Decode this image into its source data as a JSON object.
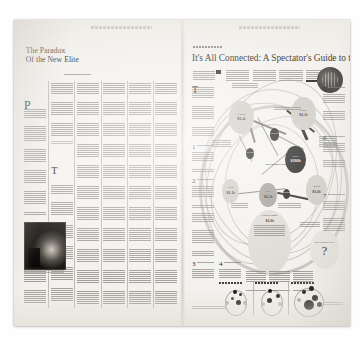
{
  "image": {
    "kind": "photograph-of-newspaper-spread",
    "publication": "The New York Times",
    "background_color": "#ffffff",
    "paper_color": "#f3f1ed",
    "ink_color": "#100f0a"
  },
  "left_page": {
    "folio_text": "THE NEW YORK TIMES, SUNDAY, ...",
    "headline_line1": "The Paradox",
    "headline_line2": "Of the New Elite",
    "dropcaps": [
      "P",
      "T"
    ],
    "subhead": "Reframing the American myth is what is really rewarding the elite.",
    "photo_caption": "photo"
  },
  "right_page": {
    "folio_text": "THE NEW YORK TIMES, SUNDAY, ...",
    "kicker": "SUNDAY BUSINESS",
    "headline": "It's All Connected: A Spectator's Guide to the Euro Crisis",
    "deck": "Charting the web of debt exposure among rippling economies",
    "legend_label": "Exposure",
    "sections": [
      {
        "number": "1",
        "title_line1": "Where Debt",
        "title_line2": "Has Gone"
      },
      {
        "number": "2",
        "title_line1": "And Then Bad",
        "title_line2": "Got Worse"
      },
      {
        "number": "3",
        "title_line1": "Threatening",
        "title_line2": "Contagion"
      },
      {
        "number": "4",
        "title_line1": "The Credit",
        "title_line2": "Crunch Spreads"
      },
      {
        "number": "5",
        "title_line1": "And Maybe",
        "title_line2": "Another Recession"
      },
      {
        "number": "6",
        "title_line1": "A Very Delicate",
        "title_line2": "Sort Of Surgery"
      },
      {
        "number": "7",
        "title_line1": "Any Way Out?",
        "title_line2": ""
      }
    ],
    "center_label": "The Market Now",
    "nodes": [
      {
        "id": "germany",
        "label": "Germany",
        "value": "$1.2t",
        "tone": "light"
      },
      {
        "id": "france",
        "label": "France",
        "value": "$1.1t",
        "tone": "mid"
      },
      {
        "id": "greece",
        "label": "Greece",
        "value": "$380b",
        "tone": "dark"
      },
      {
        "id": "italy",
        "label": "Italy",
        "value": "$2.1t",
        "tone": "light"
      },
      {
        "id": "spain",
        "label": "Spain",
        "value": "$1.1t",
        "tone": "mid"
      },
      {
        "id": "britain",
        "label": "Britain",
        "value": "$1.0t",
        "tone": "light"
      },
      {
        "id": "portugal",
        "label": "Portugal",
        "value": "",
        "tone": "dark"
      },
      {
        "id": "ireland",
        "label": "Ireland",
        "value": "",
        "tone": "dark"
      },
      {
        "id": "belgium",
        "label": "Belgium",
        "value": "",
        "tone": "dark"
      },
      {
        "id": "banks",
        "label": "European Banks",
        "value": "$2.6t",
        "tone": "pale"
      },
      {
        "id": "unknown",
        "label": "What Happens Next?",
        "value": "?",
        "tone": "vpale"
      }
    ],
    "panels": [
      {
        "title": "One scenario"
      },
      {
        "title": "Another scenario"
      },
      {
        "title": "The worst case"
      }
    ],
    "footnote": "Sources: Bank for International Settlements"
  }
}
